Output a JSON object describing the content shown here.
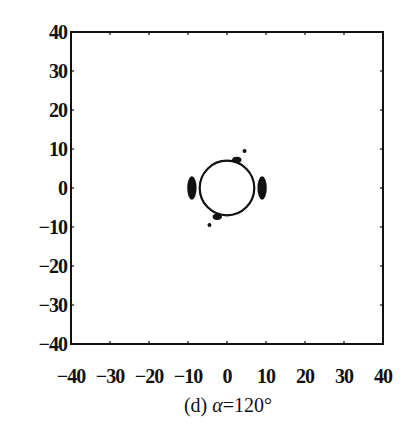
{
  "chart_data": {
    "type": "scatter",
    "title": "",
    "caption": "(d) α=120°",
    "caption_parts": {
      "prefix": "(d) ",
      "symbol": "α",
      "suffix": "=120°"
    },
    "xlabel": "",
    "ylabel": "",
    "xlim": [
      -40,
      40
    ],
    "ylim": [
      -40,
      40
    ],
    "grid": false,
    "legend": null,
    "x_ticks": [
      -40,
      -30,
      -20,
      -10,
      0,
      10,
      20,
      30,
      40
    ],
    "y_ticks": [
      40,
      30,
      20,
      10,
      0,
      -10,
      -20,
      -30,
      -40
    ],
    "x_tick_labels": [
      "-40",
      "-30",
      "-20",
      "-10",
      "0",
      "10",
      "20",
      "30",
      "40"
    ],
    "y_tick_labels": [
      "40",
      "30",
      "20",
      "10",
      "0",
      "-10",
      "-20",
      "-30",
      "-40"
    ],
    "shapes": [
      {
        "kind": "circle",
        "center": [
          0,
          0
        ],
        "radius": 7,
        "description": "ring of points"
      }
    ],
    "clusters": [
      {
        "name": "left-lobe",
        "x": -9,
        "y": 0,
        "spread_x": 1.2,
        "spread_y": 3
      },
      {
        "name": "right-lobe",
        "x": 9,
        "y": 0,
        "spread_x": 1.2,
        "spread_y": 3
      },
      {
        "name": "top-right-blob",
        "x": 2.5,
        "y": 7.2,
        "spread_x": 1.2,
        "spread_y": 0.8
      },
      {
        "name": "bottom-left-blob",
        "x": -2.5,
        "y": -7.4,
        "spread_x": 1.2,
        "spread_y": 0.8
      }
    ],
    "points": [
      {
        "x": 4.5,
        "y": 9.5
      },
      {
        "x": -4.5,
        "y": -9.5
      }
    ]
  }
}
